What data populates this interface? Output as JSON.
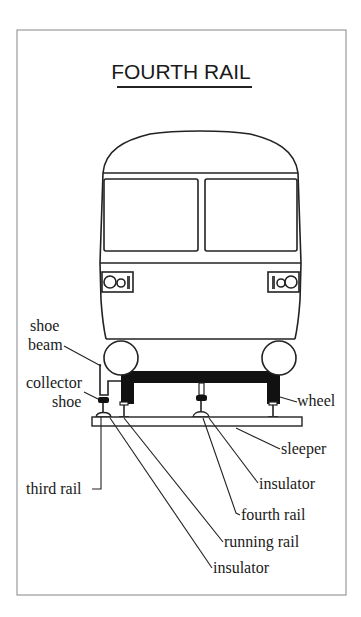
{
  "diagram": {
    "title": "FOURTH RAIL",
    "labels": {
      "shoe_beam_line1": "shoe",
      "shoe_beam_line2": "beam",
      "collector_shoe_line1": "collector",
      "collector_shoe_line2": "shoe",
      "wheel": "wheel",
      "sleeper": "sleeper",
      "insulator_upper": "insulator",
      "third_rail": "third rail",
      "fourth_rail": "fourth rail",
      "running_rail": "running rail",
      "insulator_lower": "insulator"
    },
    "colors": {
      "line": "#222222",
      "frame": "#999999",
      "background": "#ffffff"
    }
  }
}
